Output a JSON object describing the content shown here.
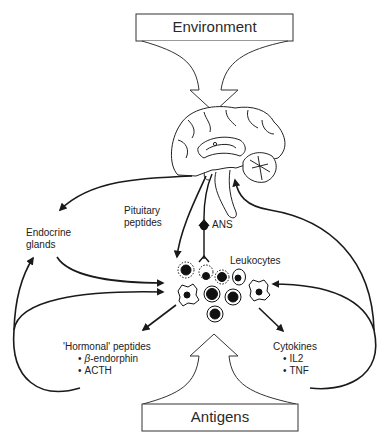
{
  "diagram": {
    "top_box": {
      "label": "Environment"
    },
    "bottom_box": {
      "label": "Antigens"
    },
    "nodes": {
      "brain": {
        "label": ""
      },
      "endocrine": {
        "label_line1": "Endocrine",
        "label_line2": "glands"
      },
      "pituitary": {
        "label_line1": "Pituitary",
        "label_line2": "peptides"
      },
      "ans": {
        "label": "ANS"
      },
      "leukocytes": {
        "label": "Leukocytes"
      },
      "hormonal": {
        "title": "'Hormonal' peptides",
        "items": [
          {
            "prefix": "β",
            "text": "-endorphin"
          },
          {
            "text": "ACTH"
          }
        ]
      },
      "cytokines": {
        "title": "Cytokines",
        "items": [
          "IL2",
          "TNF"
        ]
      }
    },
    "edges": [
      {
        "from": "Environment",
        "to": "Brain"
      },
      {
        "from": "Brain",
        "to": "Endocrine glands"
      },
      {
        "from": "Brain",
        "to": "Leukocytes",
        "label": "Pituitary peptides"
      },
      {
        "from": "Brain",
        "to": "Leukocytes",
        "label": "ANS"
      },
      {
        "from": "Endocrine glands",
        "to": "Leukocytes"
      },
      {
        "from": "Leukocytes",
        "to": "'Hormonal' peptides"
      },
      {
        "from": "Leukocytes",
        "to": "Cytokines"
      },
      {
        "from": "'Hormonal' peptides",
        "to": "Endocrine glands"
      },
      {
        "from": "'Hormonal' peptides",
        "to": "Leukocytes"
      },
      {
        "from": "Cytokines",
        "to": "Brain"
      },
      {
        "from": "Cytokines",
        "to": "Leukocytes"
      },
      {
        "from": "Antigens",
        "to": "Leukocytes"
      }
    ]
  }
}
